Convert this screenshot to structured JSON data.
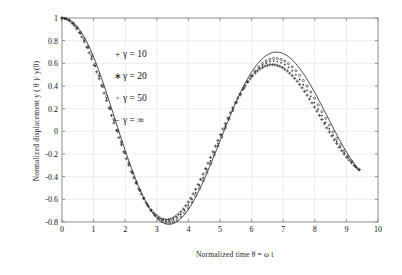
{
  "chart_data": {
    "type": "line",
    "title": "",
    "xlabel": "Normalized time  θ = ω t",
    "ylabel": "Normalized displacement   y ( θ )/ y(0)",
    "xlim": [
      0,
      10
    ],
    "ylim": [
      -0.8,
      1
    ],
    "xticks": [
      "0",
      "1",
      "2",
      "3",
      "4",
      "5",
      "6",
      "7",
      "8",
      "9",
      "10"
    ],
    "yticks": [
      "1",
      "0.8",
      "0.6",
      "0.4",
      "0.2",
      "0",
      "-0.2",
      "-0.4",
      "-0.6",
      "-0.8"
    ],
    "grid": true,
    "legend_position": "upper-left-inside",
    "series": [
      {
        "name": "γ = 10",
        "marker": "+",
        "style": "markers",
        "x": [
          0,
          0.2,
          0.4,
          0.6,
          0.8,
          1,
          1.2,
          1.4,
          1.6,
          1.8,
          2,
          2.2,
          2.4,
          2.6,
          2.8,
          3,
          3.2,
          3.4,
          3.6,
          3.8,
          4,
          4.2,
          4.4,
          4.6,
          4.8,
          5,
          5.2,
          5.4,
          5.6,
          5.8,
          6,
          6.2,
          6.4,
          6.6,
          6.8,
          7,
          7.2,
          7.4,
          7.6,
          7.8,
          8,
          8.2,
          8.4,
          8.6,
          8.8,
          9,
          9.2,
          9.4
        ],
        "y": [
          1,
          0.982,
          0.93,
          0.846,
          0.733,
          0.597,
          0.444,
          0.28,
          0.112,
          -0.054,
          -0.214,
          -0.361,
          -0.492,
          -0.601,
          -0.686,
          -0.745,
          -0.775,
          -0.776,
          -0.75,
          -0.698,
          -0.622,
          -0.527,
          -0.416,
          -0.294,
          -0.167,
          -0.038,
          0.087,
          0.205,
          0.312,
          0.404,
          0.48,
          0.536,
          0.572,
          0.588,
          0.583,
          0.558,
          0.515,
          0.456,
          0.383,
          0.3,
          0.21,
          0.116,
          0.022,
          -0.068,
          -0.151,
          -0.225,
          -0.287,
          -0.336
        ]
      },
      {
        "name": "γ = 20",
        "marker": "*",
        "style": "markers",
        "x": [
          0,
          0.2,
          0.4,
          0.6,
          0.8,
          1,
          1.2,
          1.4,
          1.6,
          1.8,
          2,
          2.2,
          2.4,
          2.6,
          2.8,
          3,
          3.2,
          3.4,
          3.6,
          3.8,
          4,
          4.2,
          4.4,
          4.6,
          4.8,
          5,
          5.2,
          5.4,
          5.6,
          5.8,
          6,
          6.2,
          6.4,
          6.6,
          6.8,
          7,
          7.2,
          7.4,
          7.6,
          7.8,
          8,
          8.2,
          8.4,
          8.6,
          8.8,
          9,
          9.2,
          9.4
        ],
        "y": [
          1,
          0.984,
          0.936,
          0.857,
          0.749,
          0.617,
          0.466,
          0.302,
          0.133,
          -0.035,
          -0.196,
          -0.347,
          -0.482,
          -0.596,
          -0.686,
          -0.75,
          -0.785,
          -0.791,
          -0.769,
          -0.721,
          -0.649,
          -0.556,
          -0.447,
          -0.325,
          -0.196,
          -0.063,
          0.067,
          0.191,
          0.305,
          0.404,
          0.487,
          0.551,
          0.594,
          0.617,
          0.617,
          0.597,
          0.557,
          0.5,
          0.427,
          0.342,
          0.249,
          0.151,
          0.052,
          -0.045,
          -0.135,
          -0.216,
          -0.286,
          -0.342
        ]
      },
      {
        "name": "γ = 50",
        "marker": "o",
        "style": "markers",
        "x": [
          0,
          0.2,
          0.4,
          0.6,
          0.8,
          1,
          1.2,
          1.4,
          1.6,
          1.8,
          2,
          2.2,
          2.4,
          2.6,
          2.8,
          3,
          3.2,
          3.4,
          3.6,
          3.8,
          4,
          4.2,
          4.4,
          4.6,
          4.8,
          5,
          5.2,
          5.4,
          5.6,
          5.8,
          6,
          6.2,
          6.4,
          6.6,
          6.8,
          7,
          7.2,
          7.4,
          7.6,
          7.8,
          8,
          8.2,
          8.4,
          8.6,
          8.8,
          9,
          9.2,
          9.4
        ],
        "y": [
          1,
          0.986,
          0.941,
          0.866,
          0.761,
          0.631,
          0.481,
          0.317,
          0.146,
          -0.024,
          -0.188,
          -0.341,
          -0.479,
          -0.597,
          -0.691,
          -0.759,
          -0.798,
          -0.808,
          -0.789,
          -0.744,
          -0.674,
          -0.583,
          -0.474,
          -0.351,
          -0.22,
          -0.084,
          0.051,
          0.18,
          0.299,
          0.404,
          0.493,
          0.562,
          0.611,
          0.638,
          0.643,
          0.626,
          0.59,
          0.535,
          0.464,
          0.38,
          0.287,
          0.187,
          0.085,
          -0.016,
          -0.112,
          -0.199,
          -0.276,
          -0.339
        ]
      },
      {
        "name": "γ = ∞",
        "marker": "-",
        "style": "line",
        "x": [
          0,
          0.2,
          0.4,
          0.6,
          0.8,
          1,
          1.2,
          1.4,
          1.6,
          1.8,
          2,
          2.2,
          2.4,
          2.6,
          2.8,
          3,
          3.2,
          3.4,
          3.6,
          3.8,
          4,
          4.2,
          4.4,
          4.6,
          4.8,
          5,
          5.2,
          5.4,
          5.6,
          5.8,
          6,
          6.2,
          6.4,
          6.6,
          6.8,
          7,
          7.2,
          7.4,
          7.6,
          7.8,
          8,
          8.2,
          8.4,
          8.6,
          8.8,
          9,
          9.2,
          9.4
        ],
        "y": [
          1,
          0.988,
          0.948,
          0.879,
          0.78,
          0.655,
          0.509,
          0.346,
          0.174,
          0.0,
          -0.169,
          -0.327,
          -0.47,
          -0.593,
          -0.692,
          -0.764,
          -0.807,
          -0.82,
          -0.803,
          -0.758,
          -0.688,
          -0.595,
          -0.484,
          -0.359,
          -0.224,
          -0.085,
          0.054,
          0.189,
          0.315,
          0.427,
          0.523,
          0.6,
          0.656,
          0.689,
          0.699,
          0.686,
          0.652,
          0.597,
          0.525,
          0.439,
          0.342,
          0.237,
          0.129,
          0.021,
          -0.084,
          -0.181,
          -0.267,
          -0.34
        ]
      }
    ]
  },
  "legend": {
    "items": [
      {
        "marker": "+",
        "label": "γ = 10"
      },
      {
        "marker": "∗",
        "label": "γ = 20"
      },
      {
        "marker": "◦",
        "label": "γ = 50"
      },
      {
        "marker": "-",
        "label": "γ = ∞"
      }
    ]
  },
  "style": {
    "axis_color": "#8a8a8a",
    "grid_color": "#e6e6e6",
    "curve_color": "#333333",
    "background": "#ffffff"
  }
}
